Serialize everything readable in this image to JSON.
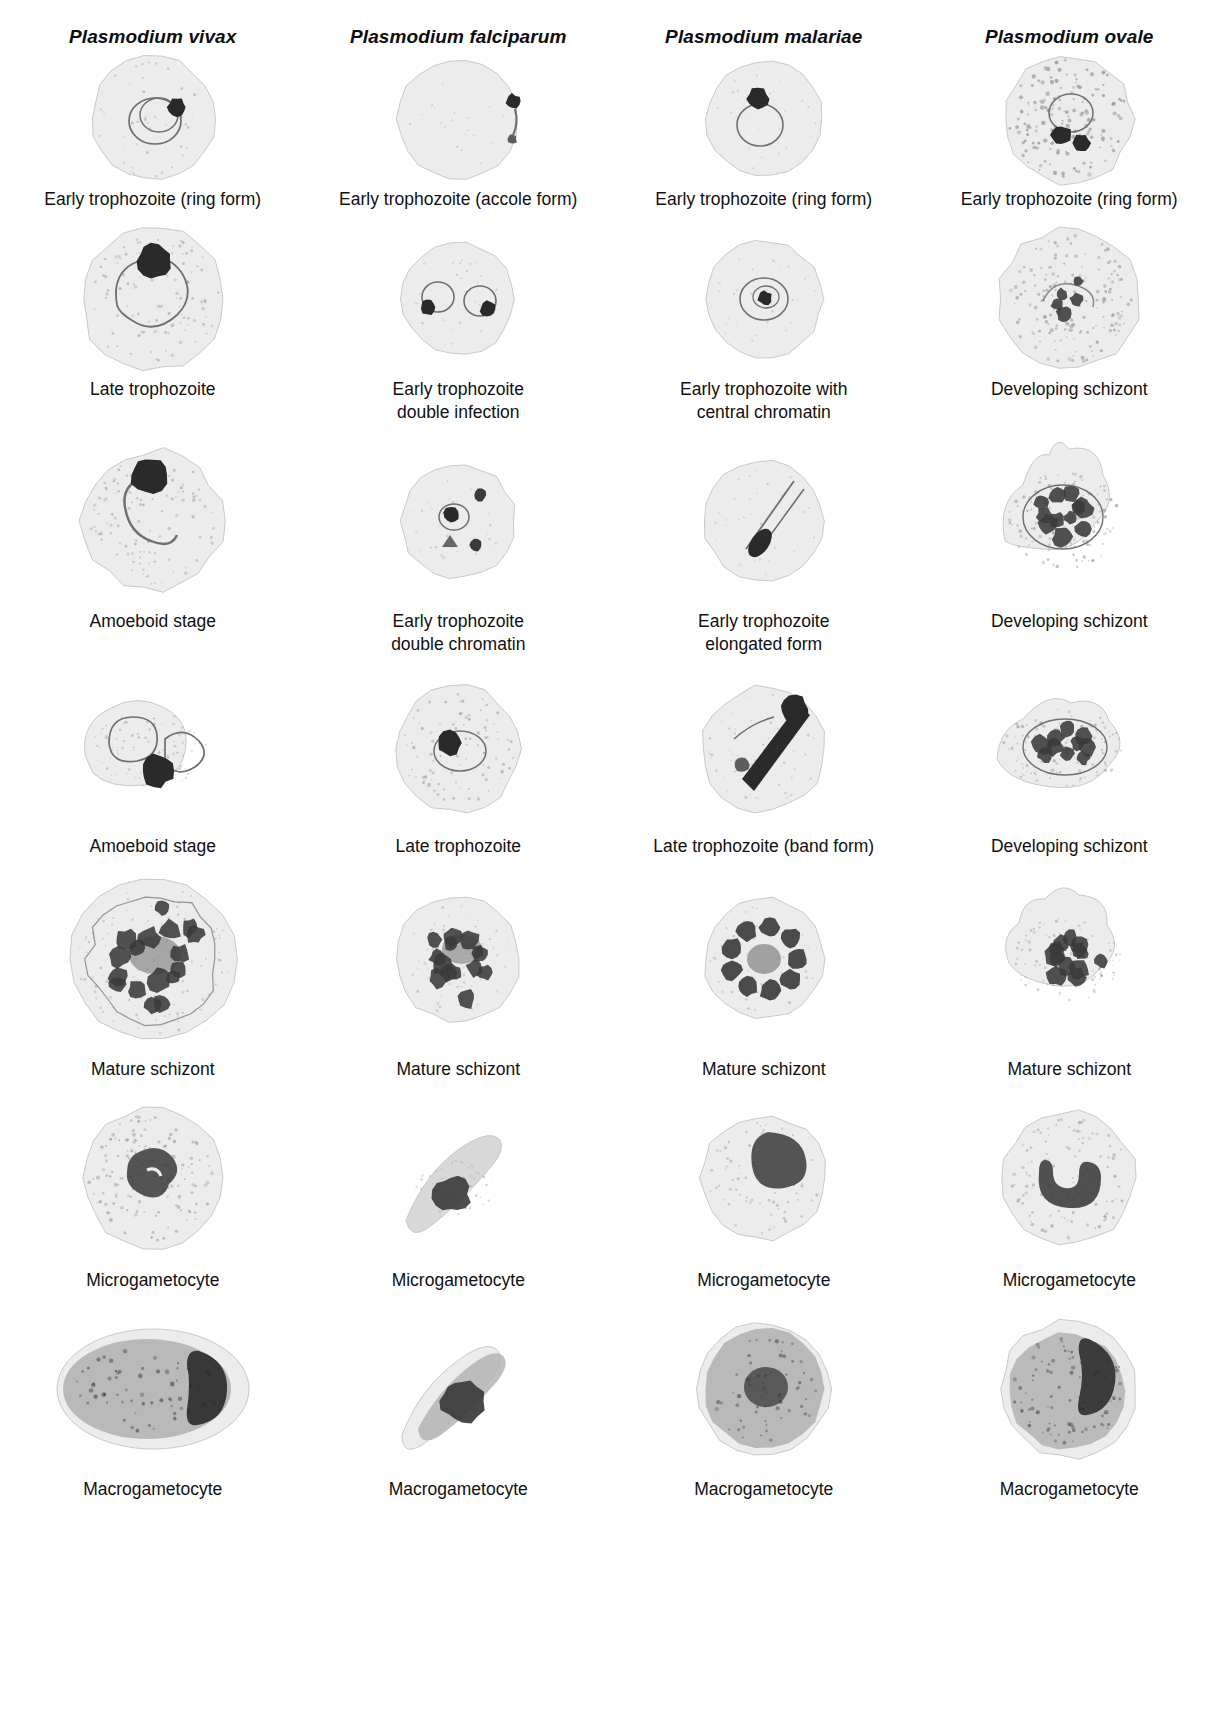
{
  "figure": {
    "background": "#ffffff",
    "text_color": "#101010"
  },
  "columns": [
    {
      "id": "vivax",
      "species": "Plasmodium vivax"
    },
    {
      "id": "falciparum",
      "species": "Plasmodium falciparum"
    },
    {
      "id": "malariae",
      "species": "Plasmodium malariae"
    },
    {
      "id": "ovale",
      "species": "Plasmodium ovale"
    }
  ],
  "palette": {
    "rbc_fill": "#ececec",
    "rbc_fill_dark": "#d8d8d8",
    "rbc_edge": "#c9c9c9",
    "stipple": "#9a9a9a",
    "chromatin": "#3a3a3a",
    "chromatin_dark": "#2a2a2a",
    "cytoplasm_line": "#6f6f6f",
    "pigment": "#8f8f8f",
    "gametocyte_body": "#b0b0b0"
  },
  "rows": [
    {
      "index": 1,
      "cells": [
        {
          "column": "vivax",
          "caption": "Early trophozoite (ring form)",
          "morph": "ring",
          "lines": 1
        },
        {
          "column": "falciparum",
          "caption": "Early trophozoite (accole form)",
          "morph": "accole",
          "lines": 1
        },
        {
          "column": "malariae",
          "caption": "Early trophozoite (ring form)",
          "morph": "ring-compact",
          "lines": 1
        },
        {
          "column": "ovale",
          "caption": "Early trophozoite (ring form)",
          "morph": "ring-stippled",
          "lines": 1
        }
      ]
    },
    {
      "index": 2,
      "cells": [
        {
          "column": "vivax",
          "caption": "Late trophozoite",
          "morph": "late-troph-vivax",
          "lines": 1
        },
        {
          "column": "falciparum",
          "caption": "Early trophozoite\ndouble infection",
          "morph": "double-ring",
          "lines": 2
        },
        {
          "column": "malariae",
          "caption": "Early trophozoite with\ncentral chromatin",
          "morph": "central-chromatin",
          "lines": 2
        },
        {
          "column": "ovale",
          "caption": "Developing schizont",
          "morph": "dev-schizont-faint",
          "lines": 1
        }
      ]
    },
    {
      "index": 3,
      "cells": [
        {
          "column": "vivax",
          "caption": "Amoeboid stage",
          "morph": "amoeboid-1",
          "lines": 1
        },
        {
          "column": "falciparum",
          "caption": "Early trophozoite\ndouble chromatin",
          "morph": "double-chromatin",
          "lines": 2
        },
        {
          "column": "malariae",
          "caption": "Early trophozoite\nelongated form",
          "morph": "elongated",
          "lines": 2
        },
        {
          "column": "ovale",
          "caption": "Developing schizont",
          "morph": "dev-schizont-fimbriated",
          "lines": 1
        }
      ]
    },
    {
      "index": 4,
      "cells": [
        {
          "column": "vivax",
          "caption": "Amoeboid stage",
          "morph": "amoeboid-2",
          "lines": 1
        },
        {
          "column": "falciparum",
          "caption": "Late trophozoite",
          "morph": "late-troph-fal",
          "lines": 1
        },
        {
          "column": "malariae",
          "caption": "Late trophozoite (band form)",
          "morph": "band-form",
          "lines": 1
        },
        {
          "column": "ovale",
          "caption": "Developing schizont",
          "morph": "dev-schizont-oval",
          "lines": 1
        }
      ]
    },
    {
      "index": 5,
      "cells": [
        {
          "column": "vivax",
          "caption": "Mature schizont",
          "morph": "schizont-large",
          "lines": 1
        },
        {
          "column": "falciparum",
          "caption": "Mature schizont",
          "morph": "schizont-medium",
          "lines": 1
        },
        {
          "column": "malariae",
          "caption": "Mature schizont",
          "morph": "schizont-rosette",
          "lines": 1
        },
        {
          "column": "ovale",
          "caption": "Mature schizont",
          "morph": "schizont-irregular",
          "lines": 1
        }
      ]
    },
    {
      "index": 6,
      "cells": [
        {
          "column": "vivax",
          "caption": "Microgametocyte",
          "morph": "micro-round",
          "lines": 1
        },
        {
          "column": "falciparum",
          "caption": "Microgametocyte",
          "morph": "micro-banana",
          "lines": 1
        },
        {
          "column": "malariae",
          "caption": "Microgametocyte",
          "morph": "micro-compact",
          "lines": 1
        },
        {
          "column": "ovale",
          "caption": "Microgametocyte",
          "morph": "micro-crescent",
          "lines": 1
        }
      ]
    },
    {
      "index": 7,
      "cells": [
        {
          "column": "vivax",
          "caption": "Macrogametocyte",
          "morph": "macro-oval",
          "lines": 1
        },
        {
          "column": "falciparum",
          "caption": "Macrogametocyte",
          "morph": "macro-banana",
          "lines": 1
        },
        {
          "column": "malariae",
          "caption": "Macrogametocyte",
          "morph": "macro-round",
          "lines": 1
        },
        {
          "column": "ovale",
          "caption": "Macrogametocyte",
          "morph": "macro-ovale",
          "lines": 1
        }
      ]
    }
  ]
}
